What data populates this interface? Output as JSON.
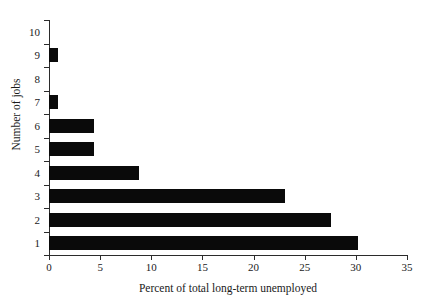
{
  "chart_data": {
    "type": "bar",
    "orientation": "horizontal",
    "title": "",
    "xlabel": "Percent of total long-term unemployed",
    "ylabel": "Number of jobs",
    "categories": [
      "1",
      "2",
      "3",
      "4",
      "5",
      "6",
      "7",
      "8",
      "9",
      "10"
    ],
    "values": [
      30.2,
      27.6,
      23.1,
      8.8,
      4.4,
      4.4,
      0.9,
      0,
      0.9,
      0
    ],
    "xlim": [
      0,
      35
    ],
    "xticks": [
      "0",
      "5",
      "10",
      "15",
      "20",
      "25",
      "30",
      "35"
    ],
    "xtick_values": [
      0,
      5,
      10,
      15,
      20,
      25,
      30,
      35
    ],
    "yticks": [
      "1",
      "2",
      "3",
      "4",
      "5",
      "6",
      "7",
      "8",
      "9",
      "10"
    ],
    "grid": false,
    "legend": null,
    "bar_color": "#0a0a0a",
    "axis_color": "#2b2b2b",
    "background": "#ffffff"
  }
}
